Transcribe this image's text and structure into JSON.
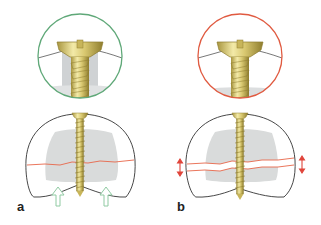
{
  "figure": {
    "panels": [
      {
        "id": "a",
        "label": "a",
        "inset_ring_color": "#5fa878",
        "fracture_line_color": "#e8664a",
        "arrow_color": "#9fd4b0",
        "arrow_type": "compression-arrows-up",
        "arrow_count": 2
      },
      {
        "id": "b",
        "label": "b",
        "inset_ring_color": "#e05a40",
        "fracture_line_color": "#e8664a",
        "arrow_color": "#e0443a",
        "arrow_type": "gap-double-arrows",
        "arrow_count": 2
      }
    ],
    "colors": {
      "screw_light": "#f3eaa8",
      "screw_mid": "#d9c870",
      "screw_dark": "#a8953e",
      "bone_outline": "#333333",
      "cancellous": "#d9dbdb",
      "background": "#ffffff"
    }
  }
}
